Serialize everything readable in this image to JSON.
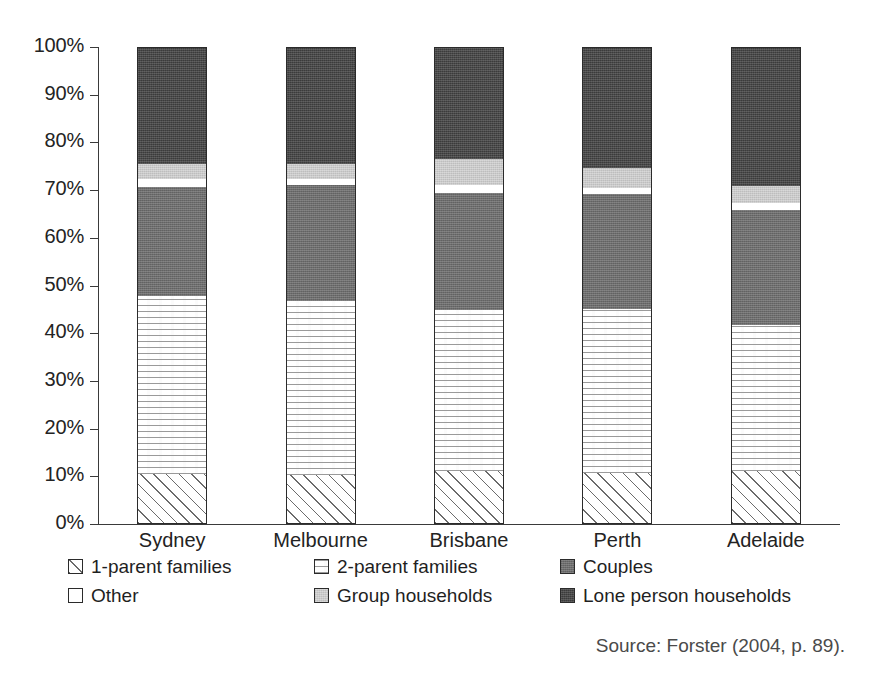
{
  "chart_data": {
    "type": "bar",
    "subtype": "stacked-percentage-column",
    "title": "",
    "xlabel": "",
    "ylabel": "",
    "ylim": [
      0,
      100
    ],
    "grid": false,
    "legend_position": "bottom",
    "categories": [
      "Sydney",
      "Melbourne",
      "Brisbane",
      "Perth",
      "Adelaide"
    ],
    "y_ticks": [
      "0%",
      "10%",
      "20%",
      "30%",
      "40%",
      "50%",
      "60%",
      "70%",
      "80%",
      "90%",
      "100%"
    ],
    "y_tick_values": [
      0,
      10,
      20,
      30,
      40,
      50,
      60,
      70,
      80,
      90,
      100
    ],
    "series": [
      {
        "name": "1-parent families",
        "key": "1parent",
        "values": [
          10.5,
          10.3,
          11.1,
          10.7,
          11.1
        ]
      },
      {
        "name": "2-parent families",
        "key": "2parent",
        "values": [
          37.3,
          36.5,
          33.7,
          34.3,
          30.7
        ]
      },
      {
        "name": "Couples",
        "key": "couples",
        "values": [
          22.9,
          24.3,
          24.7,
          24.1,
          24.1
        ]
      },
      {
        "name": "Other",
        "key": "other",
        "values": [
          1.7,
          1.3,
          1.5,
          1.3,
          1.3
        ]
      },
      {
        "name": "Group households",
        "key": "group",
        "values": [
          3.1,
          3.1,
          5.5,
          4.2,
          3.6
        ]
      },
      {
        "name": "Lone person households",
        "key": "lone",
        "values": [
          24.5,
          24.5,
          23.5,
          25.4,
          29.2
        ]
      }
    ],
    "source": "Source: Forster (2004, p. 89)."
  },
  "legend": {
    "items": [
      {
        "label": "1-parent families",
        "key": "1parent",
        "row": 0,
        "col": 0
      },
      {
        "label": "2-parent families",
        "key": "2parent",
        "row": 0,
        "col": 1
      },
      {
        "label": "Couples",
        "key": "couples",
        "row": 0,
        "col": 2
      },
      {
        "label": "Other",
        "key": "other",
        "row": 1,
        "col": 0
      },
      {
        "label": "Group households",
        "key": "group",
        "row": 1,
        "col": 1
      },
      {
        "label": "Lone person households",
        "key": "lone",
        "row": 1,
        "col": 2
      }
    ]
  },
  "colors": {
    "axis": "#3a3a3a",
    "text": "#232323",
    "couples": "#6d6d6d",
    "group": "#c9c9c9",
    "lone": "#3b3b3b",
    "other": "#ffffff",
    "background": "#ffffff"
  },
  "source_note": "Source: Forster (2004, p. 89)."
}
